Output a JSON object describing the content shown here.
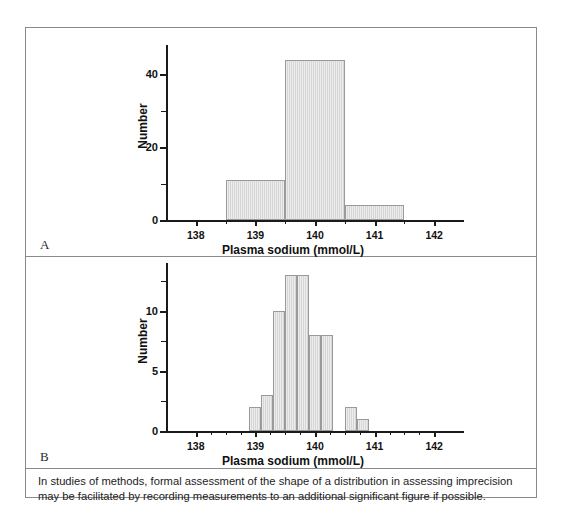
{
  "figure": {
    "caption": "In studies of methods, formal assessment of the shape of a distribution in assessing imprecision may be facilitated by recording measurements to an additional significant figure if possible."
  },
  "panels": [
    {
      "label": "A",
      "panel_id": "panel-a"
    },
    {
      "label": "B",
      "panel_id": "panel-b"
    }
  ],
  "chart_data": [
    {
      "panel": "A",
      "type": "bar",
      "title": "",
      "xlabel": "Plasma sodium (mmol/L)",
      "ylabel": "Number",
      "xlim": [
        137.5,
        142.5
      ],
      "ylim": [
        0,
        48
      ],
      "xticks": [
        138,
        139,
        140,
        141,
        142
      ],
      "xtick_labels": [
        "138",
        "139",
        "140",
        "141",
        "142"
      ],
      "xminor_ticks": [
        138.5,
        139.5,
        140.5,
        141.5
      ],
      "yticks": [
        0,
        20,
        40
      ],
      "ytick_labels": [
        "0",
        "20",
        "40"
      ],
      "yminor_ticks": [
        10,
        30
      ],
      "grid": false,
      "legend": "none",
      "bin_width": 1,
      "bins": [
        {
          "left": 138.5,
          "right": 139.5,
          "center": 139,
          "value": 11
        },
        {
          "left": 139.5,
          "right": 140.5,
          "center": 140,
          "value": 44
        },
        {
          "left": 140.5,
          "right": 141.5,
          "center": 141,
          "value": 4
        }
      ],
      "categories": [
        "139",
        "140",
        "141"
      ],
      "values": [
        11,
        44,
        4
      ]
    },
    {
      "panel": "B",
      "type": "bar",
      "title": "",
      "xlabel": "Plasma sodium (mmol/L)",
      "ylabel": "Number",
      "xlim": [
        137.5,
        142.5
      ],
      "ylim": [
        0,
        14
      ],
      "xticks": [
        138,
        139,
        140,
        141,
        142
      ],
      "xtick_labels": [
        "138",
        "139",
        "140",
        "141",
        "142"
      ],
      "xminor_ticks": [
        138.25,
        138.5,
        138.75,
        139.25,
        139.5,
        139.75,
        140.25,
        140.5,
        140.75,
        141.25,
        141.5,
        141.75
      ],
      "yticks": [
        0,
        5,
        10
      ],
      "ytick_labels": [
        "0",
        "5",
        "10"
      ],
      "yminor_ticks": [
        2.5,
        7.5,
        12.5
      ],
      "grid": false,
      "legend": "none",
      "bin_width": 0.2,
      "bins": [
        {
          "left": 138.9,
          "right": 139.1,
          "center": 139.0,
          "value": 2
        },
        {
          "left": 139.1,
          "right": 139.3,
          "center": 139.2,
          "value": 3
        },
        {
          "left": 139.3,
          "right": 139.5,
          "center": 139.4,
          "value": 10
        },
        {
          "left": 139.5,
          "right": 139.7,
          "center": 139.6,
          "value": 13
        },
        {
          "left": 139.7,
          "right": 139.9,
          "center": 139.8,
          "value": 13
        },
        {
          "left": 139.9,
          "right": 140.1,
          "center": 140.0,
          "value": 8
        },
        {
          "left": 140.1,
          "right": 140.3,
          "center": 140.2,
          "value": 8
        },
        {
          "left": 140.5,
          "right": 140.7,
          "center": 140.6,
          "value": 2
        },
        {
          "left": 140.7,
          "right": 140.9,
          "center": 140.8,
          "value": 1
        }
      ],
      "categories": [
        "139.0",
        "139.2",
        "139.4",
        "139.6",
        "139.8",
        "140.0",
        "140.2",
        "140.6",
        "140.8"
      ],
      "values": [
        2,
        3,
        10,
        13,
        13,
        8,
        8,
        2,
        1
      ]
    }
  ],
  "colors": {
    "bar_fill": "#d6d6d6",
    "bar_stroke": "#9a9a9a",
    "axis": "#1a1a1a",
    "border": "#8a8a8a",
    "text": "#111111"
  }
}
